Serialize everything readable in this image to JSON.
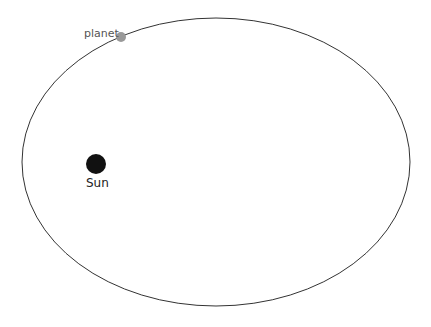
{
  "diagram": {
    "orbit": {
      "cx": 216,
      "cy": 162,
      "rx": 194,
      "ry": 144,
      "stroke": "#333333"
    },
    "sun": {
      "label": "Sun",
      "cx": 96,
      "cy": 164,
      "r": 10,
      "color": "#111111"
    },
    "planet": {
      "label": "planet",
      "cx": 121,
      "cy": 37,
      "r": 5,
      "color": "#999999"
    }
  }
}
